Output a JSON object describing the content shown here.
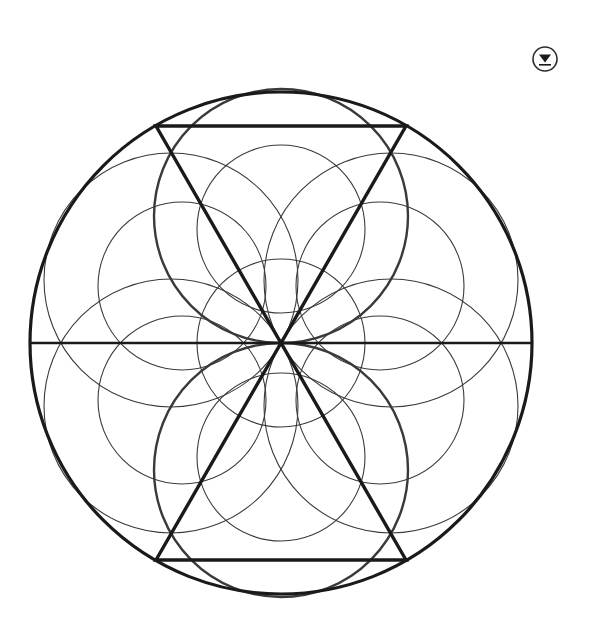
{
  "page": {
    "background_color": "#ffffff",
    "width": 593,
    "height": 626
  },
  "toolbar": {
    "download_icon_name": "download-icon",
    "download_label": "Download"
  },
  "figure": {
    "name": "sacred-geometry-diagram",
    "stroke_color_heavy": "#1a1a1a",
    "stroke_color_light": "#3a3a3a",
    "fill": "none",
    "center": {
      "x": 281,
      "y": 343
    },
    "outer_circle": {
      "cx": 281,
      "cy": 343,
      "r": 251,
      "stroke_width": 3.2
    },
    "horizontal_diameter": {
      "x1": 30,
      "y1": 343,
      "x2": 532,
      "y2": 343,
      "stroke_width": 2.6
    },
    "hexagram_vertices": [
      {
        "x": 532,
        "y": 343,
        "angle_deg": 0
      },
      {
        "x": 406,
        "y": 126,
        "angle_deg": 60
      },
      {
        "x": 156,
        "y": 126,
        "angle_deg": 120
      },
      {
        "x": 30,
        "y": 343,
        "angle_deg": 180
      },
      {
        "x": 156,
        "y": 560,
        "angle_deg": 240
      },
      {
        "x": 406,
        "y": 560,
        "angle_deg": 300
      }
    ],
    "triangle_up": {
      "points": "406,126 156,126 281,343",
      "stroke_width": 3.4
    },
    "triangle_down": {
      "points": "156,560 406,560 281,343",
      "stroke_width": 3.4
    },
    "central_circle": {
      "cx": 281,
      "cy": 343,
      "r": 84,
      "stroke_width": 1.1
    },
    "small_circles_radius": 84,
    "small_circles_orbit": 84,
    "small_circles": [
      {
        "cx": 281,
        "cy": 229,
        "label": "top"
      },
      {
        "cx": 380,
        "cy": 286,
        "label": "upper-right"
      },
      {
        "cx": 380,
        "cy": 400,
        "label": "lower-right"
      },
      {
        "cx": 281,
        "cy": 457,
        "label": "bottom"
      },
      {
        "cx": 182,
        "cy": 400,
        "label": "lower-left"
      },
      {
        "cx": 182,
        "cy": 286,
        "label": "upper-left"
      }
    ],
    "large_circles_radius": 127,
    "large_circles": [
      {
        "cx": 281,
        "cy": 216,
        "label": "top",
        "stroke_width": 2.4
      },
      {
        "cx": 391,
        "cy": 280,
        "label": "upper-right",
        "stroke_width": 1.1
      },
      {
        "cx": 391,
        "cy": 406,
        "label": "lower-right",
        "stroke_width": 1.1
      },
      {
        "cx": 281,
        "cy": 470,
        "label": "bottom",
        "stroke_width": 2.4
      },
      {
        "cx": 171,
        "cy": 406,
        "label": "lower-left",
        "stroke_width": 1.1
      },
      {
        "cx": 171,
        "cy": 280,
        "label": "upper-left",
        "stroke_width": 1.1
      }
    ]
  }
}
